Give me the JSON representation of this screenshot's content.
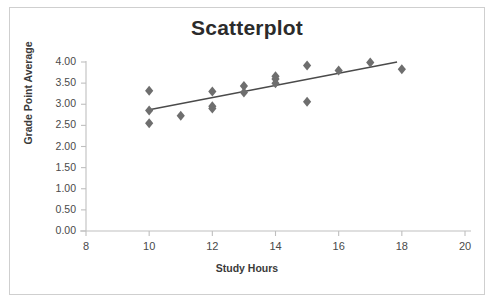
{
  "chart_data": {
    "type": "scatter",
    "title": "Scatterplot",
    "xlabel": "Study Hours",
    "ylabel": "Grade Point Average",
    "xlim": [
      8,
      20
    ],
    "ylim": [
      0.0,
      4.0
    ],
    "xticks": [
      "8",
      "10",
      "12",
      "14",
      "16",
      "18",
      "20"
    ],
    "xtick_values": [
      8,
      10,
      12,
      14,
      16,
      18,
      20
    ],
    "yticks": [
      "0.00",
      "0.50",
      "1.00",
      "1.50",
      "2.00",
      "2.50",
      "3.00",
      "3.50",
      "4.00"
    ],
    "ytick_values": [
      0.0,
      0.5,
      1.0,
      1.5,
      2.0,
      2.5,
      3.0,
      3.5,
      4.0
    ],
    "grid": false,
    "legend": "none",
    "marker": "diamond",
    "marker_color": "#6e6e6e",
    "trendline_color": "#4a4a4a",
    "axis_color": "#bfbfbf",
    "points": [
      {
        "x": 10,
        "y": 3.32
      },
      {
        "x": 10,
        "y": 2.85
      },
      {
        "x": 10,
        "y": 2.55
      },
      {
        "x": 11,
        "y": 2.73
      },
      {
        "x": 12,
        "y": 3.3
      },
      {
        "x": 12,
        "y": 2.95
      },
      {
        "x": 12,
        "y": 2.9
      },
      {
        "x": 13,
        "y": 3.43
      },
      {
        "x": 13,
        "y": 3.28
      },
      {
        "x": 14,
        "y": 3.66
      },
      {
        "x": 14,
        "y": 3.6
      },
      {
        "x": 14,
        "y": 3.5
      },
      {
        "x": 15,
        "y": 3.92
      },
      {
        "x": 15,
        "y": 3.06
      },
      {
        "x": 16,
        "y": 3.8
      },
      {
        "x": 17,
        "y": 3.99
      },
      {
        "x": 18,
        "y": 3.83
      }
    ],
    "trendline": {
      "x_start": 10.0,
      "y_start": 2.87,
      "x_end": 17.85,
      "y_end": 4.0
    }
  }
}
